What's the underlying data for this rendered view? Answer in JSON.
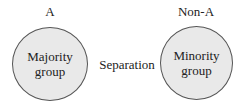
{
  "diagram": {
    "left": {
      "header": "A",
      "text_line1": "Majority",
      "text_line2": "group"
    },
    "middle": {
      "text": "Separation"
    },
    "right": {
      "header": "Non-A",
      "text_line1": "Minority",
      "text_line2": "group"
    },
    "colors": {
      "circle_fill": "#e9e9e9",
      "circle_stroke": "#555555",
      "text": "#222222"
    }
  }
}
